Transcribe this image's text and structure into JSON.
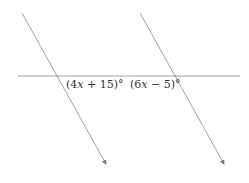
{
  "diagram": {
    "type": "parallel-lines-transversal",
    "lines": [
      {
        "name": "transversal",
        "x1": 18,
        "y1": 76,
        "x2": 240,
        "y2": 76,
        "arrow": false
      },
      {
        "name": "parallel-left",
        "x1": 22,
        "y1": 13,
        "x2": 106,
        "y2": 164,
        "arrow": true
      },
      {
        "name": "parallel-right",
        "x1": 140,
        "y1": 13,
        "x2": 224,
        "y2": 164,
        "arrow": true
      }
    ],
    "labels": {
      "angle_left": "(4x + 15)°",
      "angle_left_parts": {
        "open": "(4",
        "var": "x",
        "rest": " + 15)°"
      },
      "angle_right": "(6x − 5)°",
      "angle_right_parts": {
        "open": "(6",
        "var": "x",
        "rest": " − 5)°"
      }
    },
    "colors": {
      "line": "#8a8a8a",
      "text": "#333333"
    }
  }
}
